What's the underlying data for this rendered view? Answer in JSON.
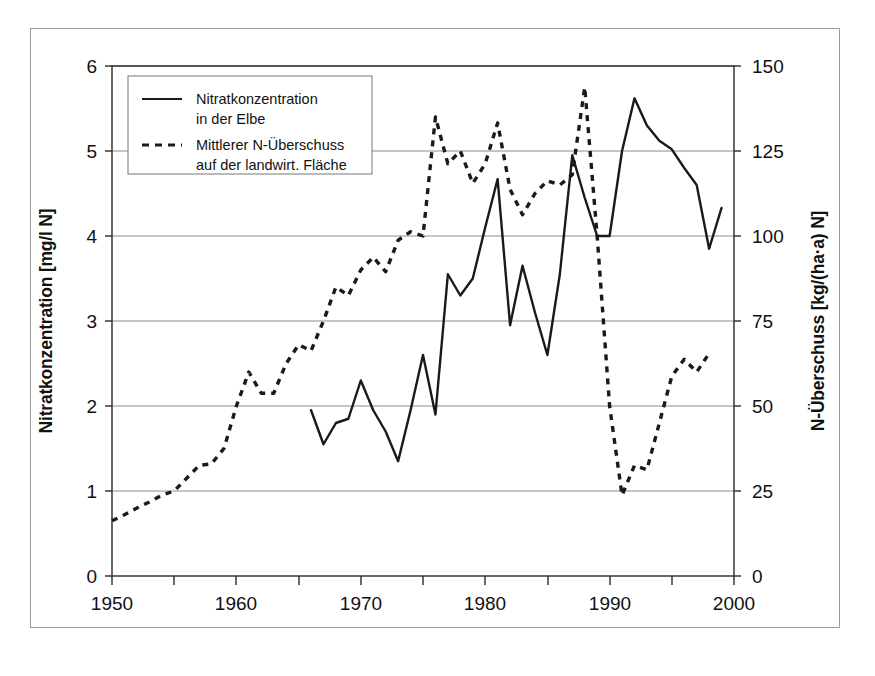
{
  "figure": {
    "title_visible": false,
    "left_axis_label": "Nitratkonzentration [mg/l N]",
    "right_axis_label": "N-Überschuss [kg/(ha·a) N]",
    "x_axis_label": ""
  },
  "legend": {
    "position": "top-left-inside",
    "entries": [
      {
        "style": "solid",
        "line1": "Nitratkonzentration",
        "line2": "in der Elbe"
      },
      {
        "style": "dashed",
        "line1": "Mittlerer N-Überschuss",
        "line2": "auf der landwirt. Fläche"
      }
    ]
  },
  "axes": {
    "x_ticks_labeled": [
      "1950",
      "1960",
      "1970",
      "1980",
      "1990",
      "2000"
    ],
    "x_ticks_minor": [
      "1955",
      "1965",
      "1975",
      "1985",
      "1995"
    ],
    "y_left_ticks": [
      "0",
      "1",
      "2",
      "3",
      "4",
      "5",
      "6"
    ],
    "y_right_ticks": [
      "0",
      "25",
      "50",
      "75",
      "100",
      "125",
      "150"
    ]
  },
  "colors": {
    "ink": "#1a1a1a",
    "grid": "#8c8c8c",
    "frame": "#9a9a9a",
    "background": "#ffffff"
  },
  "chart_data": {
    "type": "line",
    "title": "",
    "xlabel": "",
    "ylabel": "Nitratkonzentration [mg/l N]",
    "y2label": "N-Überschuss [kg/(ha·a) N]",
    "xlim": [
      1950,
      2000
    ],
    "ylim": [
      0,
      6
    ],
    "y2lim": [
      0,
      150
    ],
    "xticks": [
      1950,
      1955,
      1960,
      1965,
      1970,
      1975,
      1980,
      1985,
      1990,
      1995,
      2000
    ],
    "xticklabels": [
      "1950",
      "",
      "1960",
      "",
      "1970",
      "",
      "1980",
      "",
      "1990",
      "",
      "2000"
    ],
    "yticks": [
      0,
      1,
      2,
      3,
      4,
      5,
      6
    ],
    "y2ticks": [
      0,
      25,
      50,
      75,
      100,
      125,
      150
    ],
    "grid": true,
    "legend_position": "upper left",
    "series": [
      {
        "name": "Nitratkonzentration in der Elbe",
        "style": "solid",
        "axis": "left",
        "unit": "mg/l N",
        "x": [
          1966,
          1967,
          1968,
          1969,
          1970,
          1971,
          1972,
          1973,
          1974,
          1975,
          1976,
          1977,
          1978,
          1979,
          1980,
          1981,
          1982,
          1983,
          1984,
          1985,
          1986,
          1987,
          1988,
          1989,
          1990,
          1991,
          1992,
          1993,
          1994,
          1995,
          1996,
          1997,
          1998,
          1999
        ],
        "values": [
          1.95,
          1.55,
          1.8,
          1.85,
          2.3,
          1.95,
          1.7,
          1.35,
          1.95,
          2.6,
          1.9,
          3.55,
          3.3,
          3.5,
          4.1,
          4.67,
          2.95,
          3.65,
          3.1,
          2.6,
          3.55,
          4.95,
          4.45,
          4.0,
          4.0,
          5.0,
          5.62,
          5.3,
          5.12,
          5.02,
          4.8,
          4.6,
          3.85,
          4.33
        ]
      },
      {
        "name": "Mittlerer N-Überschuss auf der landwirt. Fläche",
        "style": "dashed",
        "axis": "right",
        "unit": "kg/(ha·a) N",
        "x": [
          1950,
          1951,
          1952,
          1953,
          1954,
          1955,
          1956,
          1957,
          1958,
          1959,
          1960,
          1961,
          1962,
          1963,
          1964,
          1965,
          1966,
          1967,
          1968,
          1969,
          1970,
          1971,
          1972,
          1973,
          1974,
          1975,
          1976,
          1977,
          1978,
          1979,
          1980,
          1981,
          1982,
          1983,
          1984,
          1985,
          1986,
          1987,
          1988,
          1989,
          1990,
          1991,
          1992,
          1993,
          1994,
          1995,
          1996,
          1997,
          1998
        ],
        "values_left_scale": [
          0.65,
          0.72,
          0.8,
          0.87,
          0.95,
          1.0,
          1.15,
          1.3,
          1.32,
          1.5,
          2.0,
          2.4,
          2.15,
          2.15,
          2.5,
          2.72,
          2.65,
          3.0,
          3.4,
          3.3,
          3.6,
          3.75,
          3.58,
          3.95,
          4.05,
          4.0,
          5.4,
          4.85,
          5.0,
          4.62,
          4.85,
          5.33,
          4.55,
          4.25,
          4.5,
          4.65,
          4.6,
          4.72,
          5.75,
          4.0,
          2.0,
          0.95,
          1.3,
          1.25,
          1.8,
          2.35,
          2.55,
          2.4,
          2.62
        ],
        "values": [
          16,
          18,
          20,
          22,
          24,
          25,
          29,
          33,
          33,
          38,
          50,
          60,
          54,
          54,
          63,
          68,
          66,
          75,
          85,
          83,
          90,
          94,
          90,
          99,
          101,
          100,
          135,
          121,
          125,
          116,
          121,
          133,
          114,
          106,
          113,
          116,
          115,
          118,
          144,
          100,
          50,
          24,
          33,
          31,
          45,
          59,
          64,
          60,
          66
        ]
      }
    ]
  }
}
